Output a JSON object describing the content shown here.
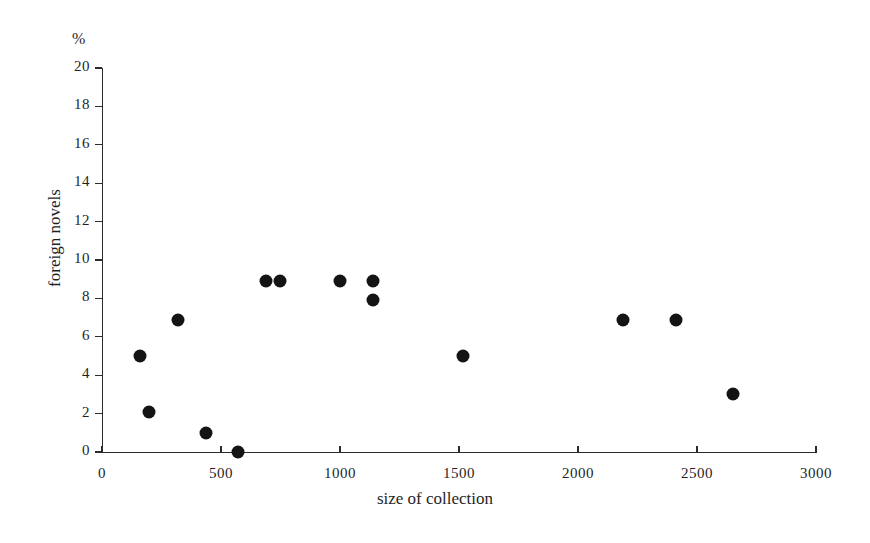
{
  "chart_data": {
    "type": "scatter",
    "title": "",
    "xlabel": "size of collection",
    "ylabel": "foreign novels",
    "unit_label": "%",
    "xlim": [
      0,
      3000
    ],
    "ylim": [
      0,
      20
    ],
    "xticks": [
      0,
      500,
      1000,
      1500,
      2000,
      2500,
      3000
    ],
    "xtick_labels": [
      "0",
      "500",
      "1000",
      "1500",
      "2000",
      "2500",
      "3000"
    ],
    "yticks": [
      0,
      2,
      4,
      6,
      8,
      10,
      12,
      14,
      16,
      18,
      20
    ],
    "ytick_labels": [
      "0",
      "2",
      "4",
      "6",
      "8",
      "10",
      "12",
      "14",
      "16",
      "18",
      "20"
    ],
    "grid": false,
    "legend": false,
    "marker": "filled-circle",
    "marker_color": "#141414",
    "points": [
      {
        "x": 160,
        "y": 5.0
      },
      {
        "x": 198,
        "y": 2.1
      },
      {
        "x": 320,
        "y": 6.9
      },
      {
        "x": 437,
        "y": 1.0
      },
      {
        "x": 572,
        "y": 0.0
      },
      {
        "x": 690,
        "y": 8.9
      },
      {
        "x": 748,
        "y": 8.9
      },
      {
        "x": 1000,
        "y": 8.9
      },
      {
        "x": 1140,
        "y": 8.9
      },
      {
        "x": 1140,
        "y": 7.9
      },
      {
        "x": 1518,
        "y": 5.0
      },
      {
        "x": 2190,
        "y": 6.9
      },
      {
        "x": 2410,
        "y": 6.9
      },
      {
        "x": 2650,
        "y": 3.0
      }
    ]
  },
  "figure": {
    "background": "#ffffff",
    "axis_color": "#2b2b2b"
  }
}
